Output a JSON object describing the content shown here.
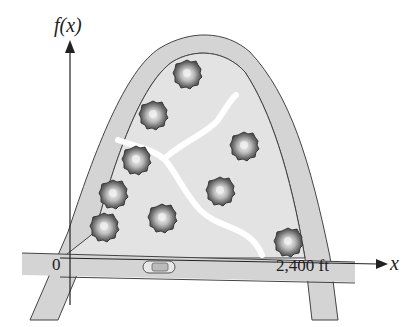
{
  "figure": {
    "y_axis_label": "f(x)",
    "x_axis_label": "x",
    "origin_label": "0",
    "distance_label": "2,400 ft",
    "objects": {
      "trees": 9,
      "car": 1,
      "paths": 2
    },
    "colors": {
      "road_fill": "#d4d4d4",
      "park_fill": "#e3e3e3",
      "path": "#ffffff",
      "outline": "#444444",
      "tree_dark": "#555555",
      "tree_light": "#eeeeee"
    }
  }
}
